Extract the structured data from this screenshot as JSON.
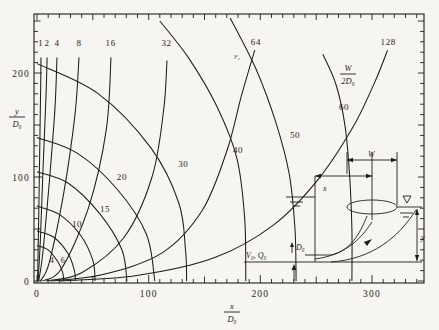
{
  "figure": {
    "background": "#f6f5f1",
    "ink": "#1f1d1a"
  },
  "axis_titles": {
    "x": {
      "num": "x",
      "den": "D₀"
    },
    "y": {
      "num": "y",
      "den": "D₀"
    }
  },
  "f0_family_label": "F₀",
  "w_family_label": {
    "num": "W",
    "den": "2D₀"
  },
  "chart_data": {
    "type": "line",
    "xlabel": "x/D₀",
    "ylabel": "y/D₀",
    "xlim": [
      0,
      350
    ],
    "ylim": [
      0,
      230
    ],
    "grid": false,
    "minor_tick_step": 10,
    "mid_tick_step": 50,
    "x_tick_labels": [
      {
        "v": 0,
        "t": "0"
      },
      {
        "v": 100,
        "t": "100"
      },
      {
        "v": 200,
        "t": "200"
      },
      {
        "v": 300,
        "t": "300"
      }
    ],
    "y_tick_labels": [
      {
        "v": 0,
        "t": "0"
      },
      {
        "v": 100,
        "t": "100"
      },
      {
        "v": 200,
        "t": "200"
      }
    ],
    "series": [
      {
        "family": "froude-number-F0",
        "legend": "F₀ = densimetric Froude number (steep trajectory curves)",
        "curves": [
          {
            "value": "1",
            "label_xy": [
              3.5,
              226
            ],
            "points": [
              [
                0.5,
                0
              ],
              [
                1.5,
                60
              ],
              [
                2.5,
                130
              ],
              [
                3.3,
                190
              ],
              [
                3.6,
                215
              ]
            ]
          },
          {
            "value": "2",
            "label_xy": [
              9,
              226
            ],
            "points": [
              [
                1,
                0
              ],
              [
                3,
                40
              ],
              [
                5.5,
                110
              ],
              [
                8,
                175
              ],
              [
                9,
                215
              ]
            ]
          },
          {
            "value": "4",
            "label_xy": [
              17.9,
              226
            ],
            "points": [
              [
                1.5,
                0
              ],
              [
                5,
                25
              ],
              [
                11,
                95
              ],
              [
                16,
                165
              ],
              [
                17.9,
                215
              ]
            ]
          },
          {
            "value": "8",
            "label_xy": [
              37.6,
              226
            ],
            "points": [
              [
                3,
                0
              ],
              [
                11,
                18
              ],
              [
                24,
                85
              ],
              [
                34,
                160
              ],
              [
                37.6,
                215
              ]
            ]
          },
          {
            "value": "16",
            "label_xy": [
              66,
              226
            ],
            "points": [
              [
                5,
                0
              ],
              [
                22,
                12
              ],
              [
                46,
                70
              ],
              [
                62,
                145
              ],
              [
                66.3,
                215
              ]
            ]
          },
          {
            "value": "32",
            "label_xy": [
              116,
              226
            ],
            "points": [
              [
                8,
                0
              ],
              [
                40,
                8
              ],
              [
                78,
                42
              ],
              [
                103,
                100
              ],
              [
                113.5,
                165
              ],
              [
                116.4,
                212
              ]
            ]
          },
          {
            "value": "64",
            "label_xy": [
              196,
              227
            ],
            "points": [
              [
                12,
                0
              ],
              [
                58,
                6
              ],
              [
                112,
                27
              ],
              [
                148,
                68
              ],
              [
                170,
                125
              ],
              [
                183,
                178
              ],
              [
                195,
                222
              ]
            ]
          },
          {
            "value": "128",
            "label_xy": [
              314.5,
              227
            ],
            "points": [
              [
                20,
                0
              ],
              [
                88,
                5
              ],
              [
                158,
                22
              ],
              [
                212,
                54
              ],
              [
                252,
                98
              ],
              [
                283,
                148
              ],
              [
                302,
                190
              ],
              [
                314,
                222
              ]
            ]
          }
        ]
      },
      {
        "family": "boil-half-width-W-2D0",
        "legend": "W/2D₀ = surface-boil half-width contours (fan curves)",
        "curves": [
          {
            "value": "4",
            "small": true,
            "label_xy": [
              13.4,
              17
            ],
            "points": [
              [
                0,
                34
              ],
              [
                10,
                30
              ],
              [
                19,
                18
              ],
              [
                23,
                8
              ],
              [
                24,
                0
              ]
            ]
          },
          {
            "value": "6",
            "small": true,
            "label_xy": [
              23.3,
              17
            ],
            "points": [
              [
                0,
                48
              ],
              [
                15,
                42
              ],
              [
                28,
                26
              ],
              [
                33.5,
                10
              ],
              [
                34.5,
                0
              ]
            ]
          },
          {
            "value": "10",
            "label_xy": [
              35.8,
              52
            ],
            "points": [
              [
                0,
                72
              ],
              [
                20,
                64
              ],
              [
                39,
                44
              ],
              [
                50,
                20
              ],
              [
                52,
                0
              ]
            ]
          },
          {
            "value": "15",
            "label_xy": [
              61,
              66
            ],
            "points": [
              [
                0,
                105
              ],
              [
                28,
                94
              ],
              [
                56,
                65
              ],
              [
                76,
                30
              ],
              [
                80.5,
                0
              ]
            ]
          },
          {
            "value": "20",
            "label_xy": [
              76,
              97
            ],
            "points": [
              [
                0,
                138
              ],
              [
                36,
                123
              ],
              [
                72,
                88
              ],
              [
                98,
                45
              ],
              [
                105.5,
                0
              ]
            ]
          },
          {
            "value": "30",
            "label_xy": [
              131,
              110
            ],
            "points": [
              [
                0,
                209
              ],
              [
                55,
                180
              ],
              [
                102,
                128
              ],
              [
                127,
                75
              ],
              [
                133,
                30
              ],
              [
                134,
                0
              ]
            ]
          },
          {
            "value": "40",
            "label_xy": [
              180,
              123
            ],
            "points": [
              [
                110,
                250
              ],
              [
                136,
                214
              ],
              [
                161,
                168
              ],
              [
                179,
                118
              ],
              [
                186,
                60
              ],
              [
                187,
                0
              ]
            ]
          },
          {
            "value": "50",
            "label_xy": [
              231,
              137.5
            ],
            "points": [
              [
                173,
                253
              ],
              [
                196,
                204
              ],
              [
                214,
                152
              ],
              [
                226,
                102
              ],
              [
                231,
                50
              ],
              [
                232,
                0
              ]
            ]
          },
          {
            "value": "60",
            "label_xy": [
              275,
              164
            ],
            "points": [
              [
                256,
                218
              ],
              [
                268,
                188
              ],
              [
                276,
                148
              ],
              [
                280,
                100
              ],
              [
                282,
                50
              ],
              [
                282,
                0
              ]
            ]
          }
        ]
      }
    ]
  },
  "inset": {
    "description": "definition sketch: horizontal jet of diameter D₀ discharged at depth y, rising to form a surface boil of width W at distance x",
    "labels": {
      "x": "x",
      "W": "W",
      "y": "y",
      "D0": "D₀",
      "VQ": "V₀, Q₀",
      "nabla": "∇"
    }
  }
}
